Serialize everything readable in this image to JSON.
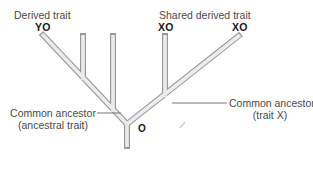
{
  "diagram": {
    "type": "cladogram",
    "top_labels": {
      "derived_trait": "Derived trait",
      "shared_derived_trait": "Shared derived trait"
    },
    "tips": [
      {
        "id": "tip-1",
        "label": "YO"
      },
      {
        "id": "tip-2",
        "label": ""
      },
      {
        "id": "tip-3",
        "label": ""
      },
      {
        "id": "tip-4",
        "label": "XO"
      },
      {
        "id": "tip-5",
        "label": "XO"
      }
    ],
    "root_node_label": "O",
    "annotations": {
      "common_ancestor_x_line1": "Common ancestor",
      "common_ancestor_x_line2": "(trait X)",
      "common_ancestor_root_line1": "Common ancestor",
      "common_ancestor_root_line2": "(ancestral trait)"
    },
    "colors": {
      "branch_fill": "#ececec",
      "branch_outline": "#9a9a9a",
      "leader_line": "#777777",
      "text": "#4a4a4a",
      "tip_text": "#1a1a1a"
    }
  }
}
